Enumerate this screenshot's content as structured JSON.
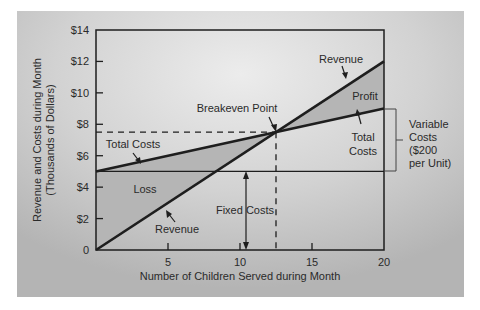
{
  "chart_data": {
    "type": "line",
    "title": "",
    "xlabel": "Number of Children Served during Month",
    "ylabel": [
      "Revenue and Costs during Month",
      "(Thousands of Dollars)"
    ],
    "xlim": [
      0,
      20
    ],
    "ylim": [
      0,
      14
    ],
    "x_ticks": [
      5,
      10,
      15,
      20
    ],
    "x_tick_labels": [
      "5",
      "10",
      "15",
      "20"
    ],
    "y_ticks": [
      0,
      2,
      4,
      6,
      8,
      10,
      12,
      14
    ],
    "y_tick_labels": [
      "0",
      "$2",
      "$4",
      "$6",
      "$8",
      "$10",
      "$12",
      "$14"
    ],
    "grid": false,
    "series": [
      {
        "name": "Revenue",
        "x": [
          0,
          20
        ],
        "values": [
          0,
          12
        ]
      },
      {
        "name": "Total Costs",
        "x": [
          0,
          20
        ],
        "values": [
          5,
          9
        ]
      },
      {
        "name": "Fixed Costs",
        "x": [
          0,
          20
        ],
        "values": [
          5,
          5
        ]
      }
    ],
    "breakeven": {
      "x": 12.5,
      "y": 7.5,
      "label": "Breakeven Point"
    },
    "annotations": {
      "revenue_top": "Revenue",
      "revenue_bottom": "Revenue",
      "total_costs_left": "Total Costs",
      "total_costs_right": [
        "Total",
        "Costs"
      ],
      "profit": "Profit",
      "loss": "Loss",
      "fixed_costs": "Fixed Costs",
      "variable_costs": [
        "Variable",
        "Costs",
        "($200",
        "per Unit)"
      ]
    },
    "regions": {
      "loss_fill": "#b9b9b9",
      "profit_fill": "#b9b9b9"
    }
  },
  "colors": {
    "panel": "#c9c9c9",
    "panel_light": "#e6e6e6",
    "line": "#1e1e1e"
  }
}
